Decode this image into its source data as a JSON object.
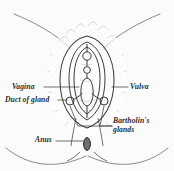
{
  "figure": {
    "type": "anatomical-line-diagram",
    "background_color": "#fbfbfb",
    "ink_color": "#3a3a3a",
    "label_color": "#2b2b2b"
  },
  "labels": {
    "vagina": "Vagina",
    "duct_of_gland": "Duct of gland",
    "vulva": "Vulva",
    "bartholin_glands_line1": "Bartholin's",
    "bartholin_glands_line2": "glands",
    "anus": "Anus"
  }
}
